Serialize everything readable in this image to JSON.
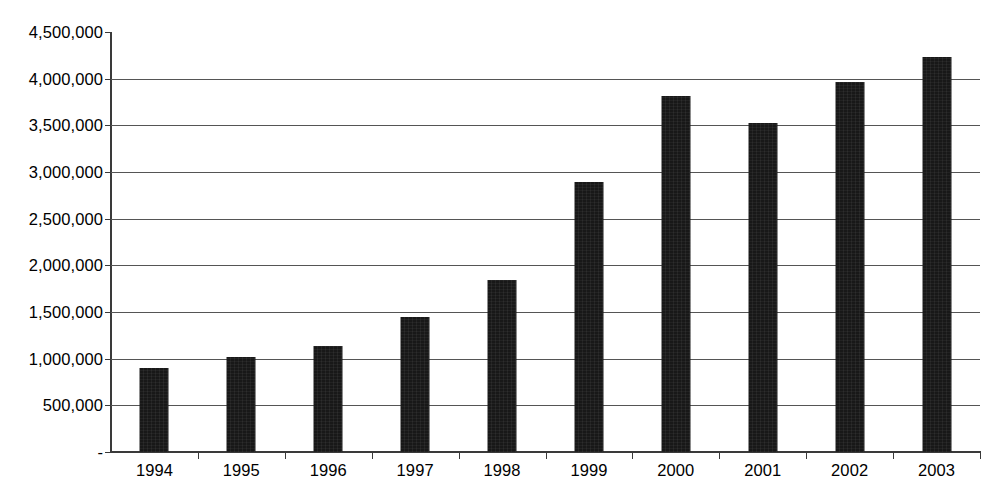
{
  "chart_data": {
    "type": "bar",
    "title": "",
    "subtitle": "",
    "xlabel": "",
    "ylabel": "",
    "categories": [
      "1994",
      "1995",
      "1996",
      "1997",
      "1998",
      "1999",
      "2000",
      "2001",
      "2002",
      "2003"
    ],
    "values": [
      900000,
      1020000,
      1140000,
      1450000,
      1840000,
      2890000,
      3810000,
      3530000,
      3960000,
      4230000
    ],
    "series": [
      {
        "name": "",
        "values": [
          900000,
          1020000,
          1140000,
          1450000,
          1840000,
          2890000,
          3810000,
          3530000,
          3960000,
          4230000
        ]
      }
    ],
    "ylim": [
      0,
      4500000
    ],
    "ytick_values": [
      0,
      500000,
      1000000,
      1500000,
      2000000,
      2500000,
      3000000,
      3500000,
      4000000,
      4500000
    ],
    "ytick_labels": [
      "-",
      "500,000",
      "1,000,000",
      "1,500,000",
      "2,000,000",
      "2,500,000",
      "3,000,000",
      "3,500,000",
      "4,000,000",
      "4,500,000"
    ],
    "grid": true,
    "grid_axis": "y",
    "legend": false,
    "legend_position": "none",
    "bar_color": "#181818",
    "axis_color": "#3a3a3a",
    "gridline_color": "#555555",
    "background_color": "#ffffff",
    "annotations": []
  }
}
